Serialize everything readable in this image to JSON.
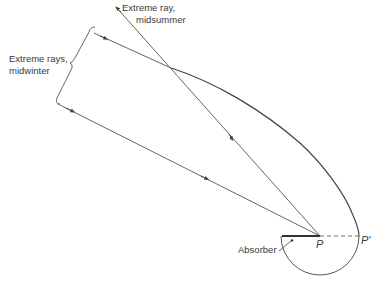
{
  "diagram": {
    "type": "solar-collector-involute",
    "labels": {
      "midsummer_line1": "Extreme ray,",
      "midsummer_line2": "midsummer",
      "midwinter_line1": "Extreme rays,",
      "midwinter_line2": "midwinter",
      "absorber": "Absorber",
      "point_p": "P",
      "point_p_prime": "P'"
    },
    "colors": {
      "line": "#555555",
      "curve": "#444444",
      "absorber": "#333333",
      "text": "#3a3a3a"
    }
  }
}
